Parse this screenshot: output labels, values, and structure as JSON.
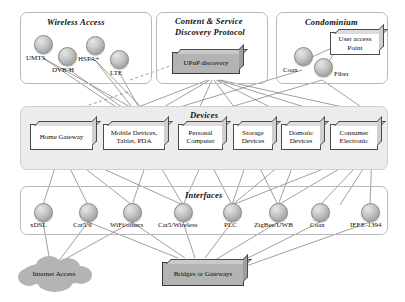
{
  "diagram": {
    "panels": [
      {
        "id": "wireless-access",
        "title": "Wireless Access"
      },
      {
        "id": "content-service",
        "title": "Content & Service Discovery Protocol",
        "line1": "Content & Service",
        "line2": "Discovery Protocol"
      },
      {
        "id": "condominium",
        "title": "Condominium"
      },
      {
        "id": "devices",
        "title": "Devices"
      },
      {
        "id": "interfaces",
        "title": "Interfaces"
      }
    ],
    "wireless_nodes": [
      {
        "label": "UMTS"
      },
      {
        "label": "DVB-H"
      },
      {
        "label": "HSPA+"
      },
      {
        "label": "LTE"
      }
    ],
    "condominium_nodes": [
      {
        "label": "Coax"
      },
      {
        "label": "Fiber"
      }
    ],
    "condominium_box": {
      "line1": "User access",
      "line2": "Point"
    },
    "protocol_box": {
      "label": "UPnP discovery"
    },
    "devices": [
      {
        "line1": "Home Gateway",
        "line2": ""
      },
      {
        "line1": "Mobile Devices,",
        "line2": "Tablet, PDA"
      },
      {
        "line1": "Personal",
        "line2": "Computer"
      },
      {
        "line1": "Storage",
        "line2": "Devices"
      },
      {
        "line1": "Domotic",
        "line2": "Devices"
      },
      {
        "line1": "Consumer",
        "line2": "Electronic"
      }
    ],
    "interfaces": [
      {
        "label": "xDSL"
      },
      {
        "label": "Cat5/6"
      },
      {
        "label": "WiFi/others"
      },
      {
        "label": "Cat5/Wireless"
      },
      {
        "label": "PLC"
      },
      {
        "label": "ZigBee/UWB"
      },
      {
        "label": "Coax"
      },
      {
        "label": "IEEE-1394"
      }
    ],
    "internet_cloud": {
      "label": "Internet Access"
    },
    "bridges_box": {
      "label": "Bridges or Gateways"
    },
    "colors": {
      "panel_border": "#b9b9b9",
      "panel_fill": "#ececec",
      "node_fill": "#c0c0c0",
      "box_fill": "#ffffff",
      "gray_box_fill": "#b3b3b3",
      "cloud_fill": "#b4b4b4",
      "line": "#6f6f6f"
    }
  }
}
